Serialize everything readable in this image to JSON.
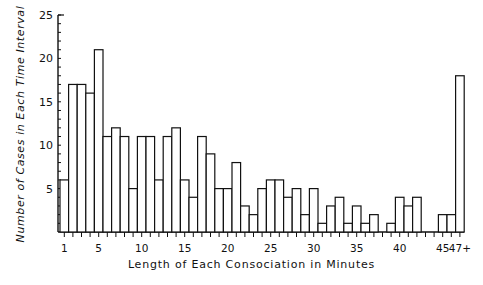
{
  "chart_data": {
    "type": "bar",
    "title": "",
    "xlabel": "Length of Each Consociation in Minutes",
    "ylabel": "Number of Cases in Each Time Interval",
    "ylim": [
      0,
      25
    ],
    "yticks": [
      5,
      10,
      15,
      20,
      25
    ],
    "xtick_labels": [
      "1",
      "5",
      "10",
      "15",
      "20",
      "25",
      "30",
      "35",
      "40",
      "45",
      "47+"
    ],
    "grid": false,
    "legend": null,
    "categories": [
      "1",
      "2",
      "3",
      "4",
      "5",
      "6",
      "7",
      "8",
      "9",
      "10",
      "11",
      "12",
      "13",
      "14",
      "15",
      "16",
      "17",
      "18",
      "19",
      "20",
      "21",
      "22",
      "23",
      "24",
      "25",
      "26",
      "27",
      "28",
      "29",
      "30",
      "31",
      "32",
      "33",
      "34",
      "35",
      "36",
      "37",
      "38",
      "39",
      "40",
      "41",
      "42",
      "43",
      "44",
      "45",
      "46",
      "47+"
    ],
    "values": [
      6,
      17,
      17,
      16,
      21,
      11,
      12,
      11,
      5,
      11,
      11,
      6,
      11,
      12,
      6,
      4,
      11,
      9,
      5,
      5,
      8,
      3,
      2,
      5,
      6,
      6,
      4,
      5,
      2,
      5,
      1,
      3,
      4,
      1,
      3,
      1,
      2,
      0,
      1,
      4,
      3,
      4,
      0,
      0,
      2,
      2,
      18
    ]
  }
}
